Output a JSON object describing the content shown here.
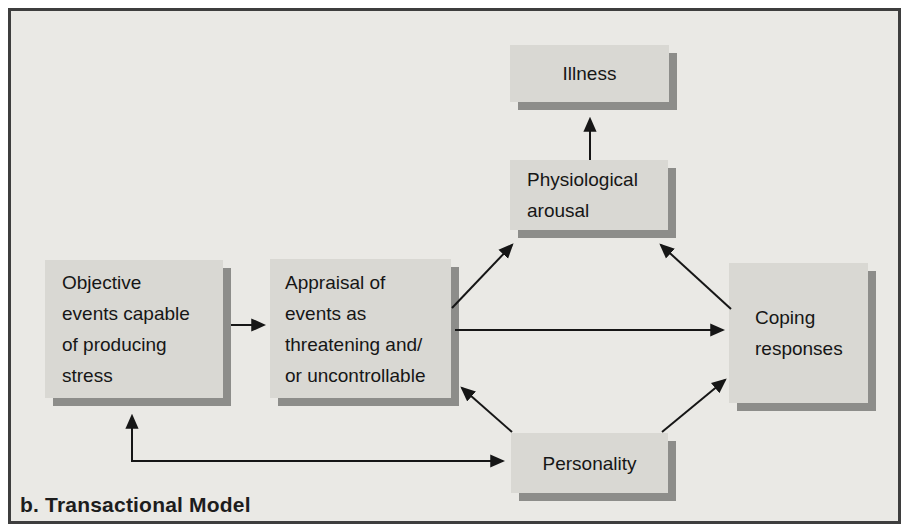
{
  "figure": {
    "caption": "b. Transactional Model"
  },
  "diagram": {
    "nodes": [
      {
        "id": "illness",
        "label": "Illness"
      },
      {
        "id": "physiological-arousal",
        "label": "Physiological\narousal"
      },
      {
        "id": "objective-events",
        "label": "Objective\nevents capable\nof producing\nstress"
      },
      {
        "id": "appraisal",
        "label": "Appraisal of\nevents as\nthreatening and/\nor uncontrollable"
      },
      {
        "id": "coping-responses",
        "label": "Coping\nresponses"
      },
      {
        "id": "personality",
        "label": "Personality"
      }
    ],
    "edges": [
      {
        "from": "physiological-arousal",
        "to": "illness",
        "bidirectional": false
      },
      {
        "from": "objective-events",
        "to": "appraisal",
        "bidirectional": false
      },
      {
        "from": "appraisal",
        "to": "physiological-arousal",
        "bidirectional": false
      },
      {
        "from": "appraisal",
        "to": "coping-responses",
        "bidirectional": false
      },
      {
        "from": "coping-responses",
        "to": "physiological-arousal",
        "bidirectional": false
      },
      {
        "from": "personality",
        "to": "appraisal",
        "bidirectional": false
      },
      {
        "from": "personality",
        "to": "coping-responses",
        "bidirectional": false
      },
      {
        "from": "objective-events",
        "to": "personality",
        "bidirectional": true
      }
    ],
    "colors": {
      "frame_background": "#eae9e5",
      "frame_border": "#3e3e3e",
      "box_fill": "#d9d8d3",
      "box_shadow": "#8d8d8a",
      "line": "#161616",
      "text": "#161616"
    }
  }
}
